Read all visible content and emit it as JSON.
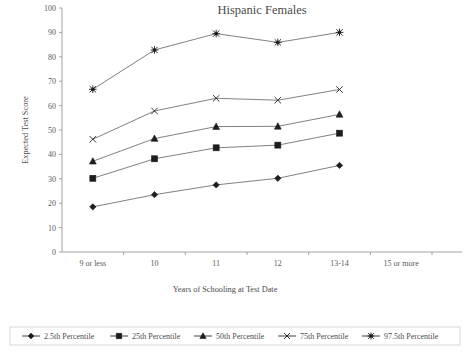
{
  "chart_data": {
    "type": "line",
    "title": "Hispanic Females",
    "xlabel": "Years of Schooling at Test Date",
    "ylabel": "Expected Test Score",
    "categories": [
      "9 or less",
      "10",
      "11",
      "12",
      "13-14",
      "15 or more"
    ],
    "ylim": [
      0,
      100
    ],
    "ytick_values": [
      0,
      10,
      20,
      30,
      40,
      50,
      60,
      70,
      80,
      90,
      100
    ],
    "ytick_labels": [
      "0",
      "10",
      "20",
      "30",
      "40",
      "50",
      "60",
      "70",
      "80",
      "90",
      "100"
    ],
    "grid": false,
    "legend_position": "bottom",
    "series": [
      {
        "name": "2.5th Percentile",
        "marker": "diamond",
        "values": [
          18.5,
          23.5,
          27.5,
          30.2,
          35.5,
          null
        ]
      },
      {
        "name": "25th Percentile",
        "marker": "square",
        "values": [
          30.2,
          38.2,
          42.7,
          43.8,
          48.7,
          null
        ]
      },
      {
        "name": "50th Percentile",
        "marker": "triangle",
        "values": [
          37.2,
          46.5,
          51.4,
          51.5,
          56.4,
          null
        ]
      },
      {
        "name": "75th Percentile",
        "marker": "x",
        "values": [
          46.2,
          57.8,
          63.0,
          62.2,
          66.6,
          null
        ]
      },
      {
        "name": "97.5th Percentile",
        "marker": "star",
        "values": [
          66.7,
          82.8,
          89.5,
          85.9,
          90.0,
          null
        ]
      }
    ]
  },
  "legend": {
    "items": [
      {
        "label": "2.5th Percentile",
        "marker": "diamond"
      },
      {
        "label": "25th Percentile",
        "marker": "square"
      },
      {
        "label": "50th Percentile",
        "marker": "triangle"
      },
      {
        "label": "75th Percentile",
        "marker": "x"
      },
      {
        "label": "97.5th Percentile",
        "marker": "star"
      }
    ]
  },
  "colors": {
    "ink": "#4a4a4a",
    "marker": "#1d1d1d",
    "axis": "#8d8d8d",
    "legend_border": "#c9c9c9",
    "background": "#ffffff"
  }
}
